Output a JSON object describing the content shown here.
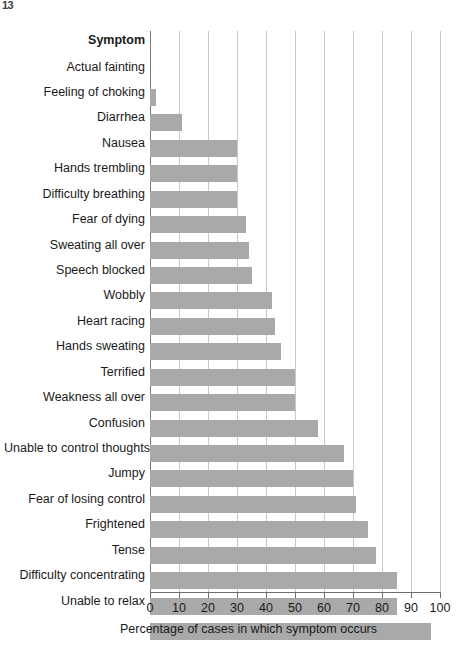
{
  "corner_artifact": {
    "text": "13"
  },
  "chart_data": {
    "type": "bar",
    "orientation": "horizontal",
    "title": "",
    "subtitle": "",
    "category_header": "Symptom",
    "xlabel": "Percentage of cases in which symptom occurs",
    "ylabel": "Symptom",
    "xlim": [
      0,
      100
    ],
    "xticks": [
      0,
      10,
      20,
      30,
      40,
      50,
      60,
      70,
      80,
      90,
      100
    ],
    "xtick_labels": [
      "0",
      "10",
      "20",
      "30",
      "40",
      "50",
      "60",
      "70",
      "80",
      "90",
      "100"
    ],
    "grid": "vertical",
    "legend": "none",
    "bar_color": "#a9a9a9",
    "gridline_color": "#c9c9c9",
    "axis_color": "#6e6e6e",
    "categories": [
      "Actual fainting",
      "Feeling of choking",
      "Diarrhea",
      "Nausea",
      "Hands trembling",
      "Difficulty breathing",
      "Fear of dying",
      "Sweating all over",
      "Speech blocked",
      "Wobbly",
      "Heart racing",
      "Hands sweating",
      "Terrified",
      "Weakness all over",
      "Confusion",
      "Unable to control thoughts",
      "Jumpy",
      "Fear of losing control",
      "Frightened",
      "Tense",
      "Difficulty concentrating",
      "Unable to relax"
    ],
    "values": [
      2,
      11,
      30,
      30,
      30,
      33,
      34,
      35,
      42,
      43,
      45,
      50,
      50,
      58,
      67,
      70,
      71,
      75,
      78,
      85,
      85,
      97
    ]
  }
}
